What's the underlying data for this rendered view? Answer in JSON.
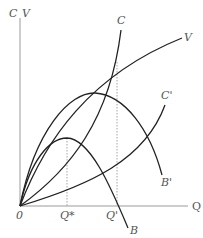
{
  "axes": {
    "y_label_c": "C",
    "y_label_v": "V",
    "x_label": "Q",
    "origin_label": "0"
  },
  "curves": {
    "C": "C",
    "V": "V",
    "C_prime": "C'",
    "B": "B",
    "B_prime": "B'"
  },
  "markers": {
    "q_star": "Q*",
    "q_prime": "Q'"
  },
  "colors": {
    "curve": "#222222",
    "axis": "#9a9a9a",
    "label": "#555555"
  }
}
